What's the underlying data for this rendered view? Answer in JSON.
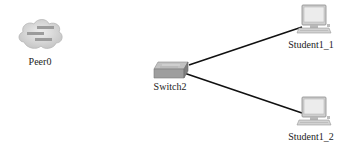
{
  "diagram": {
    "type": "network-topology",
    "nodes": [
      {
        "id": "peer0",
        "label": "Peer0",
        "kind": "cloud-icon"
      },
      {
        "id": "switch2",
        "label": "Switch2",
        "kind": "switch-icon"
      },
      {
        "id": "student1_1",
        "label": "Student1_1",
        "kind": "pc-icon"
      },
      {
        "id": "student1_2",
        "label": "Student1_2",
        "kind": "pc-icon"
      }
    ],
    "links": [
      {
        "from": "Switch2",
        "to": "Student1_1"
      },
      {
        "from": "Switch2",
        "to": "Student1_2"
      }
    ],
    "colors": {
      "background": "#ffffff",
      "link": "#111111",
      "cloud": "#d6d6d6",
      "switch": "#9a9a9a",
      "pc": "#c8c8c8"
    }
  }
}
